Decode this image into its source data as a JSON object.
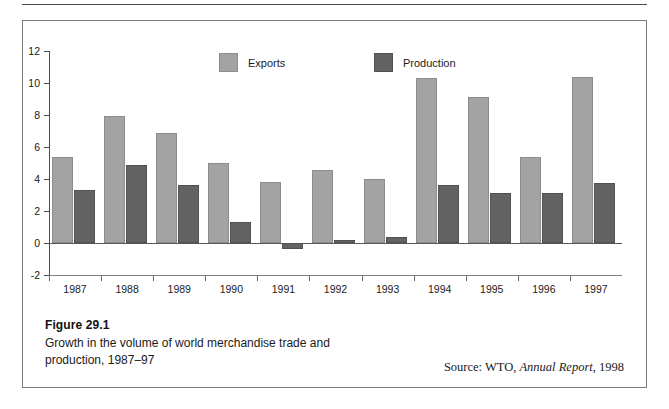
{
  "figure": {
    "number_label": "Figure 29.1",
    "description": "Growth in the volume of world merchandise trade and production, 1987–97",
    "source_prefix": "Source: WTO,",
    "source_italic": "Annual Report",
    "source_suffix": ", 1998"
  },
  "chart_data": {
    "type": "bar",
    "title": "Growth in the volume of world merchandise trade and production, 1987–97",
    "xlabel": "",
    "ylabel": "",
    "ylim": [
      -2,
      12
    ],
    "yticks": [
      -2,
      0,
      2,
      4,
      6,
      8,
      10,
      12
    ],
    "ytick_labels": [
      "-2",
      "0",
      "2",
      "4",
      "6",
      "8",
      "10",
      "12"
    ],
    "grid": false,
    "legend_position": "top-center",
    "categories": [
      "1987",
      "1988",
      "1989",
      "1990",
      "1991",
      "1992",
      "1993",
      "1994",
      "1995",
      "1996",
      "1997"
    ],
    "series": [
      {
        "name": "Exports",
        "color": "#a3a3a3",
        "values": [
          5.4,
          7.95,
          6.85,
          5.0,
          3.8,
          4.55,
          4.0,
          10.3,
          9.1,
          5.4,
          10.4
        ]
      },
      {
        "name": "Production",
        "color": "#636363",
        "values": [
          3.3,
          4.9,
          3.6,
          1.3,
          -0.4,
          0.2,
          0.4,
          3.65,
          3.15,
          3.1,
          3.75
        ]
      }
    ]
  }
}
